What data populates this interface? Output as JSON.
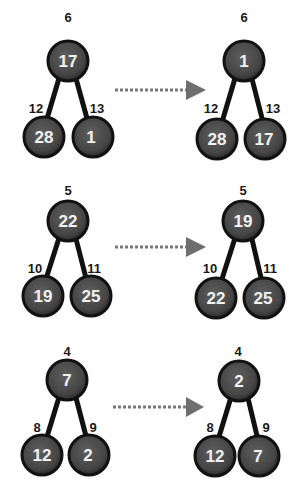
{
  "diagram": {
    "type": "heap-swap-steps",
    "colors": {
      "node_fill": "#4a4a4a",
      "node_stroke": "#111111",
      "edge": "#111111",
      "node_text": "#f2f2f2",
      "label_text": "#1a1a1a",
      "arrow": "#666666"
    },
    "rows": [
      {
        "before": {
          "root": {
            "index": "6",
            "value": "17"
          },
          "left": {
            "index": "12",
            "value": "28"
          },
          "right": {
            "index": "13",
            "value": "1"
          }
        },
        "after": {
          "root": {
            "index": "6",
            "value": "1"
          },
          "left": {
            "index": "12",
            "value": "28"
          },
          "right": {
            "index": "13",
            "value": "17"
          }
        }
      },
      {
        "before": {
          "root": {
            "index": "5",
            "value": "22"
          },
          "left": {
            "index": "10",
            "value": "19"
          },
          "right": {
            "index": "11",
            "value": "25"
          }
        },
        "after": {
          "root": {
            "index": "5",
            "value": "19"
          },
          "left": {
            "index": "10",
            "value": "22"
          },
          "right": {
            "index": "11",
            "value": "25"
          }
        }
      },
      {
        "before": {
          "root": {
            "index": "4",
            "value": "7"
          },
          "left": {
            "index": "8",
            "value": "12"
          },
          "right": {
            "index": "9",
            "value": "2"
          }
        },
        "after": {
          "root": {
            "index": "4",
            "value": "2"
          },
          "left": {
            "index": "8",
            "value": "12"
          },
          "right": {
            "index": "9",
            "value": "7"
          }
        }
      }
    ]
  }
}
